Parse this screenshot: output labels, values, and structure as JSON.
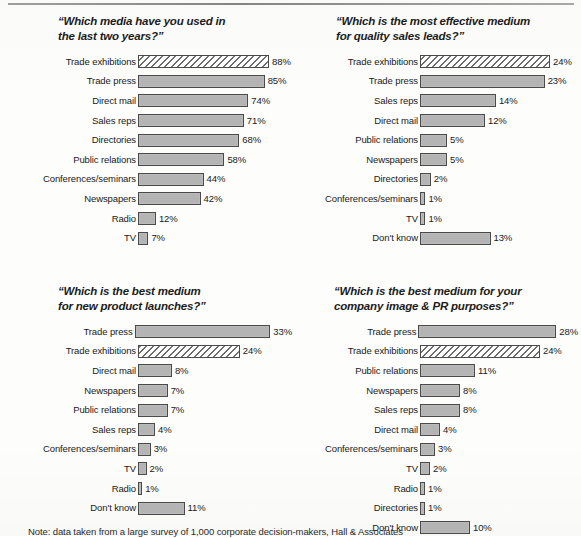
{
  "figure": {
    "footnote": "Note: data taken from a large survey of 1,000 corporate decision-makers, Hall & Associates",
    "bar_fill_color": "#b4b4b4",
    "bar_outline_color": "#4a4a4a",
    "hatch_stroke_color": "#6b6b6b",
    "background_color": "#fdfdfb"
  },
  "chart_data": [
    {
      "type": "bar",
      "orientation": "horizontal",
      "title": "“Which media have you used in\nthe last two years?”",
      "xlabel": "",
      "ylabel": "",
      "xlim": [
        0,
        88
      ],
      "grid": false,
      "legend": "none",
      "px_per_percent": 1.49,
      "categories": [
        "Trade exhibitions",
        "Trade press",
        "Direct mail",
        "Sales reps",
        "Directories",
        "Public relations",
        "Conferences/seminars",
        "Newspapers",
        "Radio",
        "TV"
      ],
      "values": [
        88,
        85,
        74,
        71,
        68,
        58,
        44,
        42,
        12,
        7
      ],
      "value_labels": [
        "88%",
        "85%",
        "74%",
        "71%",
        "68%",
        "58%",
        "44%",
        "42%",
        "12%",
        "7%"
      ],
      "highlighted": [
        "Trade exhibitions"
      ]
    },
    {
      "type": "bar",
      "orientation": "horizontal",
      "title": "“Which is the most effective medium\nfor quality sales leads?”",
      "xlabel": "",
      "ylabel": "",
      "xlim": [
        0,
        24
      ],
      "grid": false,
      "legend": "none",
      "px_per_percent": 5.42,
      "categories": [
        "Trade exhibitions",
        "Trade press",
        "Sales reps",
        "Direct mail",
        "Public relations",
        "Newspapers",
        "Directories",
        "Conferences/seminars",
        "TV",
        "Don't know"
      ],
      "values": [
        24,
        23,
        14,
        12,
        5,
        5,
        2,
        1,
        1,
        13
      ],
      "value_labels": [
        "24%",
        "23%",
        "14%",
        "12%",
        "5%",
        "5%",
        "2%",
        "1%",
        "1%",
        "13%"
      ],
      "highlighted": [
        "Trade exhibitions"
      ]
    },
    {
      "type": "bar",
      "orientation": "horizontal",
      "title": "“Which is the best medium\nfor new product launches?”",
      "xlabel": "",
      "ylabel": "",
      "xlim": [
        0,
        33
      ],
      "grid": false,
      "legend": "none",
      "px_per_percent": 4.24,
      "categories": [
        "Trade press",
        "Trade exhibitions",
        "Direct mail",
        "Newspapers",
        "Public relations",
        "Sales reps",
        "Conferences/seminars",
        "TV",
        "Radio",
        "Don't know"
      ],
      "values": [
        33,
        24,
        8,
        7,
        7,
        4,
        3,
        2,
        1,
        11
      ],
      "value_labels": [
        "33%",
        "24%",
        "8%",
        "7%",
        "7%",
        "4%",
        "3%",
        "2%",
        "1%",
        "11%"
      ],
      "highlighted": [
        "Trade exhibitions"
      ]
    },
    {
      "type": "bar",
      "orientation": "horizontal",
      "title": "“Which is the best medium for your\ncompany image & PR purposes?”",
      "xlabel": "",
      "ylabel": "",
      "xlim": [
        0,
        28
      ],
      "grid": false,
      "legend": "none",
      "px_per_percent": 5.0,
      "categories": [
        "Trade press",
        "Trade exhibitions",
        "Public relations",
        "Newspapers",
        "Sales reps",
        "Direct mail",
        "Conferences/seminars",
        "TV",
        "Radio",
        "Directories",
        "Don't know"
      ],
      "values": [
        28,
        24,
        11,
        8,
        8,
        4,
        3,
        2,
        1,
        1,
        10
      ],
      "value_labels": [
        "28%",
        "24%",
        "11%",
        "8%",
        "8%",
        "4%",
        "3%",
        "2%",
        "1%",
        "1%",
        "10%"
      ],
      "highlighted": [
        "Trade exhibitions"
      ]
    }
  ]
}
